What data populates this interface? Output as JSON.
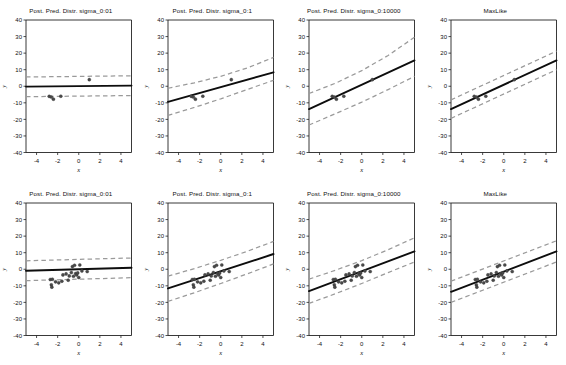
{
  "figure": {
    "width": 566,
    "height": 365,
    "background": "#ffffff",
    "rows": 2,
    "cols": 4,
    "line_color": "#0d0d0d",
    "band_color": "#9a9a9a",
    "point_color": "#4a4a4a"
  },
  "chart_data": {
    "type": "scatter",
    "title": "",
    "subtitle": "",
    "xlabel": "x",
    "ylabel": "y",
    "xlim": [
      -5,
      5
    ],
    "ylim": [
      -40,
      40
    ],
    "xticks": [
      -4,
      -2,
      0,
      2,
      4
    ],
    "yticks": [
      40,
      30,
      20,
      10,
      0,
      -10,
      -20,
      -30,
      -40
    ],
    "xticklabels": [
      "-4",
      "-2",
      "0",
      "2",
      "4"
    ],
    "yticklabels": [
      "40",
      "30",
      "20",
      "10",
      "0",
      "-10",
      "-20",
      "-30",
      "-40"
    ],
    "grid": false,
    "legend": false,
    "legend_position": "none",
    "panel_layout": "2 rows x 4 columns",
    "row_labels": [
      "N = 4 observations",
      "N = 20 observations"
    ],
    "series_names": [
      "observed data",
      "predictive mean",
      "predictive band upper",
      "predictive band lower"
    ],
    "panels": [
      {
        "index": 0,
        "row": 0,
        "col": 0,
        "title": "Post. Pred. Distr. sigma_0:01",
        "prior_sigma": 0.01,
        "mean_line": {
          "x": [
            -5,
            5
          ],
          "y": [
            -0.2,
            0.4
          ]
        },
        "upper_band": {
          "x": [
            -5,
            5
          ],
          "y": [
            5.6,
            6.3
          ]
        },
        "lower_band": {
          "x": [
            -5,
            5
          ],
          "y": [
            -6.3,
            -5.6
          ]
        },
        "points": {
          "x": [
            -2.8,
            -2.6,
            -2.4,
            -1.7,
            1.0
          ],
          "y": [
            -6.1,
            -6.5,
            -7.8,
            -6.0,
            4.0
          ]
        }
      },
      {
        "index": 1,
        "row": 0,
        "col": 1,
        "title": "Post. Pred. Distr. sigma_0:1",
        "prior_sigma": 0.1,
        "mean_line": {
          "x": [
            -5,
            5
          ],
          "y": [
            -9.4,
            8.4
          ]
        },
        "upper_band": {
          "x": [
            -5,
            -2.5,
            0,
            2.5,
            5
          ],
          "y": [
            -1.2,
            2.1,
            6.0,
            11.0,
            17.4
          ]
        },
        "lower_band": {
          "x": [
            -5,
            -2.5,
            0,
            2.5,
            5
          ],
          "y": [
            -17.6,
            -12.8,
            -7.6,
            -2.0,
            3.6
          ]
        },
        "points": {
          "x": [
            -2.8,
            -2.6,
            -2.4,
            -1.7,
            1.0
          ],
          "y": [
            -6.1,
            -6.5,
            -7.8,
            -6.0,
            4.0
          ]
        }
      },
      {
        "index": 2,
        "row": 0,
        "col": 2,
        "title": "Post. Pred. Distr. sigma_0:10000",
        "prior_sigma": 10000,
        "mean_line": {
          "x": [
            -5,
            5
          ],
          "y": [
            -13.8,
            15.6
          ]
        },
        "upper_band": {
          "x": [
            -5,
            -2.5,
            0,
            2.5,
            5
          ],
          "y": [
            -4.4,
            1.8,
            9.4,
            18.6,
            29.6
          ]
        },
        "lower_band": {
          "x": [
            -5,
            -2.5,
            0,
            2.5,
            5
          ],
          "y": [
            -23.4,
            -16.6,
            -9.6,
            -2.0,
            6.0
          ]
        },
        "points": {
          "x": [
            -2.8,
            -2.6,
            -2.4,
            -1.7,
            1.0
          ],
          "y": [
            -6.1,
            -6.5,
            -7.8,
            -6.0,
            4.0
          ]
        }
      },
      {
        "index": 3,
        "row": 0,
        "col": 3,
        "title": "MaxLike",
        "prior_sigma": null,
        "mean_line": {
          "x": [
            -5,
            5
          ],
          "y": [
            -13.8,
            15.6
          ]
        },
        "upper_band": {
          "x": [
            -5,
            5
          ],
          "y": [
            -8.2,
            21.2
          ]
        },
        "lower_band": {
          "x": [
            -5,
            5
          ],
          "y": [
            -19.4,
            10.0
          ]
        },
        "points": {
          "x": [
            -2.8,
            -2.6,
            -2.4,
            -1.7,
            1.0
          ],
          "y": [
            -6.1,
            -6.5,
            -7.8,
            -6.0,
            4.0
          ]
        }
      },
      {
        "index": 4,
        "row": 1,
        "col": 0,
        "title": "Post. Pred. Distr. sigma_0:01",
        "prior_sigma": 0.01,
        "mean_line": {
          "x": [
            -5,
            5
          ],
          "y": [
            -0.9,
            0.9
          ]
        },
        "upper_band": {
          "x": [
            -5,
            5
          ],
          "y": [
            5.1,
            6.8
          ]
        },
        "lower_band": {
          "x": [
            -5,
            5
          ],
          "y": [
            -6.9,
            -5.1
          ]
        },
        "points": {
          "x": [
            -2.7,
            -2.6,
            -2.55,
            -2.5,
            -2.2,
            -1.9,
            -1.6,
            -1.5,
            -1.2,
            -1.0,
            -0.9,
            -0.7,
            -0.6,
            -0.5,
            -0.4,
            -0.3,
            -0.2,
            -0.1,
            0.0,
            0.1,
            0.3,
            0.8
          ],
          "y": [
            -6.2,
            -9.4,
            -10.8,
            -6.0,
            -7.6,
            -8.2,
            -7.2,
            -3.4,
            -2.8,
            -6.6,
            -4.0,
            -2.0,
            1.6,
            -4.2,
            2.4,
            -2.6,
            -3.4,
            -2.2,
            -5.0,
            2.6,
            -1.0,
            -1.4
          ]
        }
      },
      {
        "index": 5,
        "row": 1,
        "col": 1,
        "title": "Post. Pred. Distr. sigma_0:1",
        "prior_sigma": 0.1,
        "mean_line": {
          "x": [
            -5,
            5
          ],
          "y": [
            -11.6,
            9.2
          ]
        },
        "upper_band": {
          "x": [
            -5,
            -2.5,
            0,
            2.5,
            5
          ],
          "y": [
            -4.2,
            0.4,
            5.4,
            10.8,
            16.8
          ]
        },
        "lower_band": {
          "x": [
            -5,
            -2.5,
            0,
            2.5,
            5
          ],
          "y": [
            -19.4,
            -14.2,
            -8.6,
            -2.8,
            3.2
          ]
        },
        "points": {
          "x": [
            -2.7,
            -2.6,
            -2.55,
            -2.5,
            -2.2,
            -1.9,
            -1.6,
            -1.5,
            -1.2,
            -1.0,
            -0.9,
            -0.7,
            -0.6,
            -0.5,
            -0.4,
            -0.3,
            -0.2,
            -0.1,
            0.0,
            0.1,
            0.3,
            0.8
          ],
          "y": [
            -6.2,
            -9.4,
            -10.8,
            -6.0,
            -7.6,
            -8.2,
            -7.2,
            -3.4,
            -2.8,
            -6.6,
            -4.0,
            -2.0,
            1.6,
            -4.2,
            2.4,
            -2.6,
            -3.4,
            -2.2,
            -5.0,
            2.6,
            -1.0,
            -1.4
          ]
        }
      },
      {
        "index": 6,
        "row": 1,
        "col": 2,
        "title": "Post. Pred. Distr. sigma_0:10000",
        "prior_sigma": 10000,
        "mean_line": {
          "x": [
            -5,
            5
          ],
          "y": [
            -13.2,
            10.8
          ]
        },
        "upper_band": {
          "x": [
            -5,
            -2.5,
            0,
            2.5,
            5
          ],
          "y": [
            -6.0,
            -0.6,
            5.2,
            11.8,
            19.0
          ]
        },
        "lower_band": {
          "x": [
            -5,
            -2.5,
            0,
            2.5,
            5
          ],
          "y": [
            -20.6,
            -14.8,
            -8.6,
            -2.0,
            4.4
          ]
        },
        "points": {
          "x": [
            -2.7,
            -2.6,
            -2.55,
            -2.5,
            -2.2,
            -1.9,
            -1.6,
            -1.5,
            -1.2,
            -1.0,
            -0.9,
            -0.7,
            -0.6,
            -0.5,
            -0.4,
            -0.3,
            -0.2,
            -0.1,
            0.0,
            0.1,
            0.3,
            0.8
          ],
          "y": [
            -6.2,
            -9.4,
            -10.8,
            -6.0,
            -7.6,
            -8.2,
            -7.2,
            -3.4,
            -2.8,
            -6.6,
            -4.0,
            -2.0,
            1.6,
            -4.2,
            2.4,
            -2.6,
            -3.4,
            -2.2,
            -5.0,
            2.6,
            -1.0,
            -1.4
          ]
        }
      },
      {
        "index": 7,
        "row": 1,
        "col": 3,
        "title": "MaxLike",
        "prior_sigma": null,
        "mean_line": {
          "x": [
            -5,
            5
          ],
          "y": [
            -13.6,
            10.8
          ]
        },
        "upper_band": {
          "x": [
            -5,
            5
          ],
          "y": [
            -7.2,
            17.2
          ]
        },
        "lower_band": {
          "x": [
            -5,
            5
          ],
          "y": [
            -20.0,
            4.4
          ]
        },
        "points": {
          "x": [
            -2.7,
            -2.6,
            -2.55,
            -2.5,
            -2.2,
            -1.9,
            -1.6,
            -1.5,
            -1.2,
            -1.0,
            -0.9,
            -0.7,
            -0.6,
            -0.5,
            -0.4,
            -0.3,
            -0.2,
            -0.1,
            0.0,
            0.1,
            0.3,
            0.8
          ],
          "y": [
            -6.2,
            -9.4,
            -10.8,
            -6.0,
            -7.6,
            -8.2,
            -7.2,
            -3.4,
            -2.8,
            -6.6,
            -4.0,
            -2.0,
            1.6,
            -4.2,
            2.4,
            -2.6,
            -3.4,
            -2.2,
            -5.0,
            2.6,
            -1.0,
            -1.4
          ]
        }
      }
    ]
  }
}
